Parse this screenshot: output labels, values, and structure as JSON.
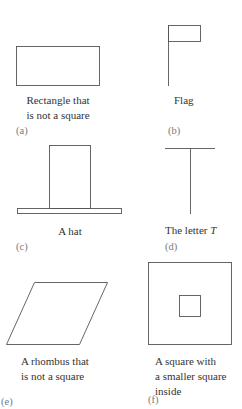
{
  "figures": [
    {
      "id": "a",
      "label": "(a)",
      "caption_lines": [
        "Rectangle that",
        "is not a square"
      ],
      "shape": "rectangle"
    },
    {
      "id": "b",
      "label": "(b)",
      "caption_lines": [
        "Flag"
      ],
      "shape": "flag"
    },
    {
      "id": "c",
      "label": "(c)",
      "caption_lines": [
        "A hat"
      ],
      "shape": "hat"
    },
    {
      "id": "d",
      "label": "(d)",
      "caption_prefix": "The letter ",
      "caption_italic": "T",
      "shape": "letter-t"
    },
    {
      "id": "e",
      "label": "(e)",
      "caption_lines": [
        "A rhombus that",
        "is not a square"
      ],
      "shape": "rhombus"
    },
    {
      "id": "f",
      "label": "(f)",
      "caption_lines": [
        "A square with",
        "a smaller square",
        "inside"
      ],
      "shape": "nested-squares"
    }
  ],
  "colors": {
    "stroke": "#555555",
    "text": "#333333",
    "label": "#7a7a7a"
  }
}
